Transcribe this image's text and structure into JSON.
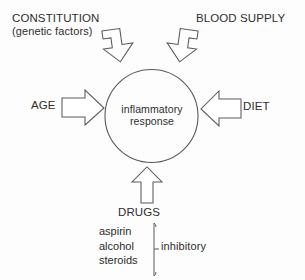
{
  "diagram": {
    "title_text_present": false,
    "center": {
      "name": "central-node",
      "line1": "inflammatory",
      "line2": "response"
    },
    "factors": [
      {
        "id": "constitution",
        "label": "CONSTITUTION",
        "sublabel": "(genetic factors)",
        "arrow": "arrow-down-right",
        "position": "top-left"
      },
      {
        "id": "blood-supply",
        "label": "BLOOD SUPPLY",
        "sublabel": "",
        "arrow": "arrow-down-left",
        "position": "top-right"
      },
      {
        "id": "age",
        "label": "AGE",
        "sublabel": "",
        "arrow": "arrow-right",
        "position": "left"
      },
      {
        "id": "diet",
        "label": "DIET",
        "sublabel": "",
        "arrow": "arrow-left",
        "position": "right"
      },
      {
        "id": "drugs",
        "label": "DRUGS",
        "sublabel": "",
        "arrow": "arrow-up",
        "position": "bottom"
      }
    ],
    "drug_examples": {
      "items": [
        "aspirin",
        "alcohol",
        "steroids"
      ],
      "brace_note": "inhibitory"
    },
    "colors": {
      "stroke": "#555555",
      "text": "#2e2e2e",
      "background": "#fdfdfd",
      "arrow_fill": "#ffffff"
    }
  }
}
